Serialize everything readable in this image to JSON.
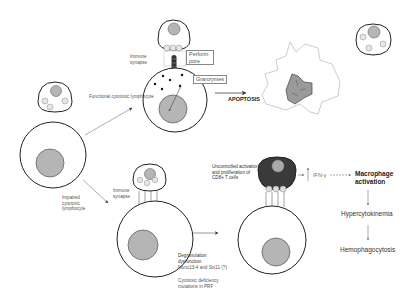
{
  "diagram": {
    "title": "",
    "labels": {
      "functional_ctl": "Functional cytotoxic lymphocyte",
      "impaired_ctl": "Impaired cytotoxic lymphocyte",
      "immune_synapse_top": "Immune synapse",
      "immune_synapse_bottom": "Immune synapse",
      "perforin_pore": "Perforin pore",
      "granzymes": "Granzymes",
      "apoptosis": "APOPTOSIS",
      "uncontrolled": "Uncontrolled activation and proliferation of CD8+ T cells",
      "ifn": "IFN-γ",
      "macrophage_activation": "Macrophage activation",
      "hypercytokinemia": "Hypercytokinemia",
      "hemophagocytosis": "Hemophagocytosis",
      "degranulation": "Degranulation dysfunction",
      "munc": "Munc13-4 and Stx11 (?)",
      "cytotoxic_deficiency": "Cytotoxic deficiency mutations in PRF"
    },
    "colors": {
      "line": "#222222",
      "nucleus_fill": "#b5b5b5",
      "granule_fill": "#d8d8d8",
      "dark_cell": "#3a3a3a",
      "arrow": "#555555"
    }
  }
}
